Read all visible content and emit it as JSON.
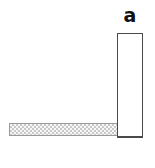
{
  "figure": {
    "label": "a",
    "colors": {
      "background": "#ffffff",
      "block_fill": "#ffffff",
      "block_border": "#4a4a4a",
      "bar_border": "#9a9a9a",
      "bar_checker_dark": "#c9c9c9",
      "bar_checker_light": "#f7f7f7",
      "label_color": "#111111"
    }
  }
}
